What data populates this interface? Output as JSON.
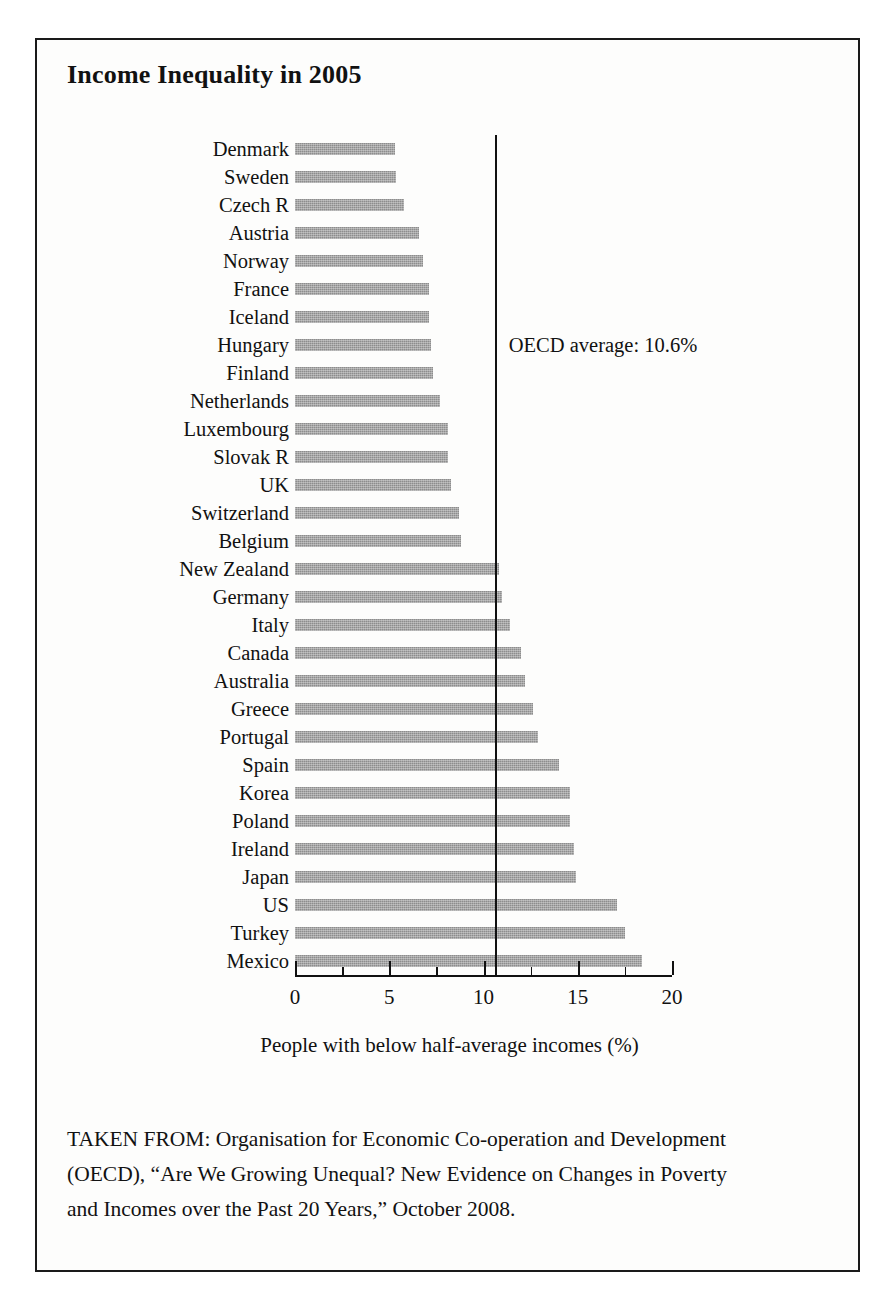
{
  "figure": {
    "title": "Income Inequality in 2005",
    "source_note": "TAKEN FROM: Organisation for Economic Co-operation and Development (OECD), “Are We Growing Unequal? New Evidence on Changes in Poverty and Incomes over the Past 20 Years,” October 2008.",
    "border_color": "#1a1a1a",
    "bar_color": "#8d8d8d",
    "line_color": "#111111",
    "background": "#fdfdfc"
  },
  "chart_data": {
    "type": "bar",
    "orientation": "horizontal",
    "title": "Income Inequality in 2005",
    "xlabel": "People with below half-average incomes (%)",
    "ylabel": "",
    "xlim": [
      0,
      20
    ],
    "xticks": [
      0,
      5,
      10,
      15,
      20
    ],
    "xtick_labels": [
      "0",
      "5",
      "10",
      "15",
      "20"
    ],
    "minor_xticks": [
      2.5,
      7.5,
      12.5,
      17.5
    ],
    "grid": false,
    "legend": "none",
    "categories": [
      "Denmark",
      "Sweden",
      "Czech R",
      "Austria",
      "Norway",
      "France",
      "Iceland",
      "Hungary",
      "Finland",
      "Netherlands",
      "Luxembourg",
      "Slovak R",
      "UK",
      "Switzerland",
      "Belgium",
      "New Zealand",
      "Germany",
      "Italy",
      "Canada",
      "Australia",
      "Greece",
      "Portugal",
      "Spain",
      "Korea",
      "Poland",
      "Ireland",
      "Japan",
      "US",
      "Turkey",
      "Mexico"
    ],
    "values": [
      5.3,
      5.35,
      5.8,
      6.6,
      6.8,
      7.1,
      7.1,
      7.2,
      7.3,
      7.7,
      8.1,
      8.1,
      8.3,
      8.7,
      8.8,
      10.8,
      11.0,
      11.4,
      12.0,
      12.2,
      12.6,
      12.9,
      14.0,
      14.6,
      14.6,
      14.8,
      14.9,
      17.1,
      17.5,
      18.4
    ],
    "annotations": [
      {
        "name": "oecd-average",
        "label": "OECD average: 10.6%",
        "value": 10.6,
        "type": "vertical-reference-line"
      }
    ]
  }
}
